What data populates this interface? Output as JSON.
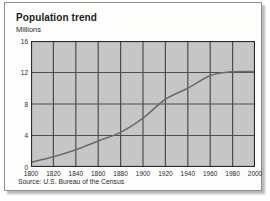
{
  "figure": {
    "title": "Population trend",
    "source": "Source: U.S. Bureau of the Census"
  },
  "colors": {
    "plot_background": "#c6c6c6",
    "gridline": "#4d4d4d",
    "axis": "#2b2b2b",
    "series_line": "#6b6b6b",
    "text": "#1c1c1c",
    "frame": "#8e8e8e",
    "page_background": "#fdfdfb"
  },
  "chart_data": {
    "type": "line",
    "title": "Population trend",
    "subtitle": "",
    "xlabel": "",
    "ylabel": "Millions",
    "xlim": [
      1800,
      2000
    ],
    "ylim": [
      0,
      16
    ],
    "xticks": [
      1800,
      1820,
      1840,
      1860,
      1880,
      1900,
      1920,
      1940,
      1960,
      1980,
      2000
    ],
    "yticks": [
      0,
      4,
      8,
      12,
      16
    ],
    "grid": true,
    "legend": false,
    "legend_position": "none",
    "annotations": [
      "Source: U.S. Bureau of the Census"
    ],
    "x": [
      1800,
      1820,
      1840,
      1860,
      1880,
      1900,
      1920,
      1940,
      1960,
      1980,
      2000
    ],
    "series": [
      {
        "name": "Population",
        "units": "Millions",
        "values": [
          0.6,
          1.3,
          2.2,
          3.3,
          4.4,
          6.2,
          8.6,
          10.0,
          11.6,
          12.1,
          12.1
        ]
      }
    ]
  }
}
